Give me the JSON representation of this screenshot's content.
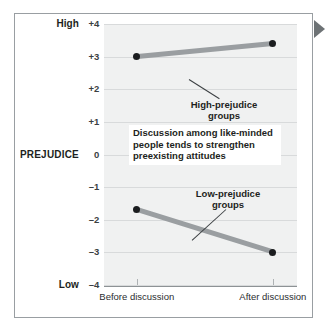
{
  "chart_data": {
    "type": "line",
    "title": "",
    "subtitle": "",
    "xlabel": "",
    "ylabel": "PREJUDICE",
    "categories": [
      "Before discussion",
      "After discussion"
    ],
    "ylim": [
      -4,
      4
    ],
    "ytick_labels": [
      "+4",
      "+3",
      "+2",
      "+1",
      "0",
      "–1",
      "–2",
      "–3",
      "–4"
    ],
    "ytick_values": [
      4,
      3,
      2,
      1,
      0,
      -1,
      -2,
      -3,
      -4
    ],
    "y_high_end_label": "High",
    "y_low_end_label": "Low",
    "grid": true,
    "legend_position": "inline-annotations",
    "series": [
      {
        "name": "High-prejudice groups",
        "values": [
          3.0,
          3.4
        ]
      },
      {
        "name": "Low-prejudice groups",
        "values": [
          -1.7,
          -3.0
        ]
      }
    ],
    "annotations": [
      "High-prejudice\ngroups",
      "Low-prejudice\ngroups",
      "Discussion among like-minded people tends to strengthen preexisting attitudes"
    ],
    "callout_text": "Discussion among like-minded people tends to strengthen preexisting attitudes",
    "colors": {
      "line": "#9a9ea1",
      "marker": "#1b1d1f",
      "plot_background": "#f0f1f1",
      "gridline": "#d8dadb",
      "frame": "#999ea2",
      "pointer": "#6d7275"
    }
  },
  "figure": {
    "pointer_icon": "triangle-right-icon"
  }
}
